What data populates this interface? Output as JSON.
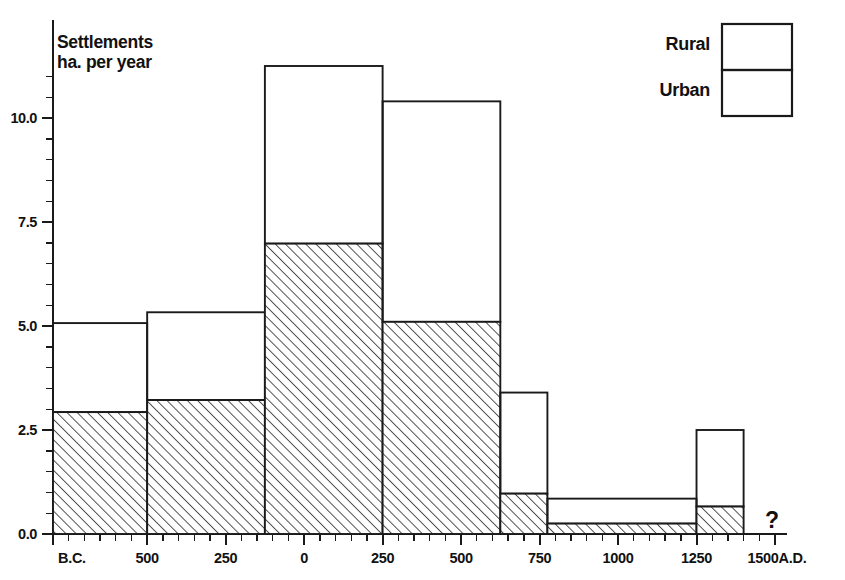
{
  "chart_data": {
    "type": "bar",
    "title": "",
    "subtitle": "",
    "ylabel_line1": "Settlements",
    "ylabel_line2": "ha. per year",
    "xlabel": "",
    "stacked": true,
    "grid": false,
    "legend_position": "top-right",
    "annotation": "?",
    "ylim": [
      0,
      11.6
    ],
    "yticks": [
      0.0,
      2.5,
      5.0,
      7.5,
      10.0
    ],
    "ytick_labels": [
      "0.0",
      "2.5",
      "5.0",
      "7.5",
      "10.0"
    ],
    "yminor_step": 0.5,
    "xlim": [
      -800,
      1500
    ],
    "xminor_step": 50,
    "xticks": [
      -800,
      -500,
      -250,
      0,
      250,
      500,
      750,
      1000,
      1250,
      1500
    ],
    "xtick_labels": [
      "B.C.",
      "500",
      "250",
      "0",
      "250",
      "500",
      "750",
      "1000",
      "1250",
      "1500A.D."
    ],
    "categories": [
      "800-500 B.C.",
      "500-250 B.C.",
      "250 B.C.-250 A.D.",
      "250-500 A.D.",
      "500-750 A.D.",
      "750-1250 A.D.",
      "1250-1400 A.D."
    ],
    "bin_edges": [
      -800,
      -500,
      -125,
      250,
      625,
      775,
      850,
      1250,
      1400
    ],
    "bins": [
      {
        "x_start": -800,
        "x_end": -500,
        "urban": 2.93,
        "rural": 2.14,
        "total": 5.07
      },
      {
        "x_start": -500,
        "x_end": -125,
        "urban": 3.22,
        "rural": 2.11,
        "total": 5.33
      },
      {
        "x_start": -125,
        "x_end": 250,
        "urban": 6.98,
        "rural": 4.27,
        "total": 11.25
      },
      {
        "x_start": 250,
        "x_end": 625,
        "urban": 5.1,
        "rural": 5.3,
        "total": 10.4
      },
      {
        "x_start": 625,
        "x_end": 775,
        "urban": 0.97,
        "rural": 2.43,
        "total": 3.4
      },
      {
        "x_start": 775,
        "x_end": 1250,
        "urban": 0.25,
        "rural": 0.6,
        "total": 0.85
      },
      {
        "x_start": 1250,
        "x_end": 1400,
        "urban": 0.66,
        "rural": 1.84,
        "total": 2.5
      }
    ],
    "series": [
      {
        "name": "Urban",
        "values": [
          2.93,
          3.22,
          6.98,
          5.1,
          0.97,
          0.25,
          0.66
        ],
        "fill": "diagonal-hatch"
      },
      {
        "name": "Rural",
        "values": [
          2.14,
          2.11,
          4.27,
          5.3,
          2.43,
          0.6,
          1.84
        ],
        "fill": "none"
      }
    ]
  },
  "legend": {
    "items": [
      {
        "label": "Rural",
        "fill": "none"
      },
      {
        "label": "Urban",
        "fill": "diagonal-hatch"
      }
    ]
  },
  "colors": {
    "ink": "#1a1a1a",
    "background": "#ffffff",
    "hatch": "#555555"
  }
}
